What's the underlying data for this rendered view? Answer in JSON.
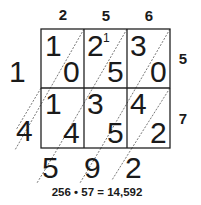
{
  "diagram": {
    "top_digits": [
      "2",
      "5",
      "6"
    ],
    "right_digits": [
      "5",
      "7"
    ],
    "cells": [
      [
        {
          "tens": "1",
          "ones": "0"
        },
        {
          "tens": "2",
          "ones": "5",
          "carry": "1"
        },
        {
          "tens": "3",
          "ones": "0"
        }
      ],
      [
        {
          "tens": "1",
          "ones": "4"
        },
        {
          "tens": "3",
          "ones": "5"
        },
        {
          "tens": "4",
          "ones": "2"
        }
      ]
    ],
    "left_results": [
      "1",
      "4"
    ],
    "bottom_results": [
      "5",
      "9",
      "2"
    ],
    "equation": "256 • 57 = 14,592"
  }
}
